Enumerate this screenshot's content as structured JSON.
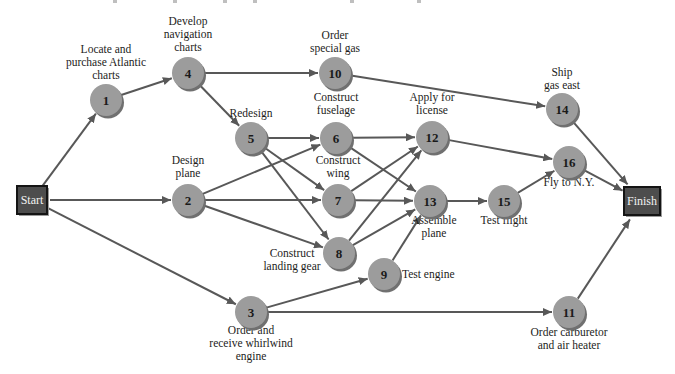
{
  "figure": {
    "background": "#ffffff",
    "cropped_caption_marks": [
      113,
      173,
      223,
      253,
      350,
      417
    ]
  },
  "network": {
    "type": "activity-on-node project network",
    "colors": {
      "node_fill": "#9c9c9c",
      "node_shadow": "#707070",
      "node_number": "#1a1a1a",
      "edge": "#585858",
      "terminal_fill": "#4d4d4d",
      "terminal_border": "#141414",
      "terminal_shadow": "#9a9a9a",
      "terminal_text": "#f2f2f2",
      "label_text": "#1d1d1b"
    },
    "node_radius": 16,
    "terminals": [
      {
        "id": "start",
        "label": "Start",
        "x": 32,
        "y": 200,
        "w": 30,
        "h": 28
      },
      {
        "id": "finish",
        "label": "Finish",
        "x": 642,
        "y": 201,
        "w": 36,
        "h": 28
      }
    ],
    "nodes": [
      {
        "id": "1",
        "x": 106,
        "y": 100,
        "label": {
          "lines": [
            "Locate and",
            "purchase Atlantic",
            "charts"
          ],
          "x": 106,
          "y": 53,
          "anchor": "middle"
        }
      },
      {
        "id": "4",
        "x": 188,
        "y": 73,
        "label": {
          "lines": [
            "Develop",
            "navigation",
            "charts"
          ],
          "x": 188,
          "y": 25,
          "anchor": "middle"
        }
      },
      {
        "id": "10",
        "x": 335,
        "y": 73,
        "label": {
          "lines": [
            "Order",
            "special gas"
          ],
          "x": 335,
          "y": 39,
          "anchor": "middle"
        }
      },
      {
        "id": "14",
        "x": 562,
        "y": 109,
        "label": {
          "lines": [
            "Ship",
            "gas east"
          ],
          "x": 562,
          "y": 76,
          "anchor": "middle"
        }
      },
      {
        "id": "5",
        "x": 251,
        "y": 138,
        "label": {
          "lines": [
            "Redesign"
          ],
          "x": 251,
          "y": 117,
          "anchor": "middle"
        }
      },
      {
        "id": "6",
        "x": 336,
        "y": 138,
        "label": {
          "lines": [
            "Construct",
            "fuselage"
          ],
          "x": 336,
          "y": 101,
          "anchor": "middle"
        }
      },
      {
        "id": "12",
        "x": 432,
        "y": 137,
        "label": {
          "lines": [
            "Apply for",
            "license"
          ],
          "x": 432,
          "y": 101,
          "anchor": "middle"
        }
      },
      {
        "id": "2",
        "x": 188,
        "y": 200,
        "label": {
          "lines": [
            "Design",
            "plane"
          ],
          "x": 188,
          "y": 164,
          "anchor": "middle"
        }
      },
      {
        "id": "7",
        "x": 338,
        "y": 200,
        "label": {
          "lines": [
            "Construct",
            "wing"
          ],
          "x": 338,
          "y": 164,
          "anchor": "middle"
        }
      },
      {
        "id": "13",
        "x": 430,
        "y": 201,
        "label": {
          "lines": [
            "Assemble",
            "plane"
          ],
          "x": 434,
          "y": 224,
          "anchor": "middle"
        }
      },
      {
        "id": "15",
        "x": 504,
        "y": 201,
        "label": {
          "lines": [
            "Test flight"
          ],
          "x": 504,
          "y": 224,
          "anchor": "middle"
        }
      },
      {
        "id": "16",
        "x": 569,
        "y": 162,
        "label": {
          "lines": [
            "Fly to N.Y."
          ],
          "x": 569,
          "y": 186,
          "anchor": "middle"
        }
      },
      {
        "id": "8",
        "x": 339,
        "y": 253,
        "label": {
          "lines": [
            "Construct",
            "landing gear"
          ],
          "x": 292,
          "y": 257,
          "anchor": "middle"
        }
      },
      {
        "id": "9",
        "x": 384,
        "y": 274,
        "label": {
          "lines": [
            "Test engine"
          ],
          "x": 402,
          "y": 278,
          "anchor": "start"
        }
      },
      {
        "id": "3",
        "x": 251,
        "y": 312,
        "label": {
          "lines": [
            "Order and",
            "receive whirlwind",
            "engine"
          ],
          "x": 251,
          "y": 334,
          "anchor": "middle"
        }
      },
      {
        "id": "11",
        "x": 569,
        "y": 312,
        "label": {
          "lines": [
            "Order carburetor",
            "and air heater"
          ],
          "x": 569,
          "y": 336,
          "anchor": "middle"
        }
      }
    ],
    "edges": [
      [
        "start",
        "1"
      ],
      [
        "start",
        "2"
      ],
      [
        "start",
        "3"
      ],
      [
        "1",
        "4"
      ],
      [
        "4",
        "10"
      ],
      [
        "4",
        "5"
      ],
      [
        "10",
        "14"
      ],
      [
        "14",
        "finish"
      ],
      [
        "5",
        "6"
      ],
      [
        "5",
        "7"
      ],
      [
        "5",
        "8"
      ],
      [
        "2",
        "6"
      ],
      [
        "2",
        "7"
      ],
      [
        "2",
        "8"
      ],
      [
        "6",
        "12"
      ],
      [
        "6",
        "13"
      ],
      [
        "7",
        "12"
      ],
      [
        "7",
        "13"
      ],
      [
        "8",
        "12"
      ],
      [
        "8",
        "13"
      ],
      [
        "3",
        "9"
      ],
      [
        "3",
        "11"
      ],
      [
        "9",
        "13"
      ],
      [
        "12",
        "16"
      ],
      [
        "13",
        "15"
      ],
      [
        "15",
        "16"
      ],
      [
        "16",
        "finish"
      ],
      [
        "11",
        "finish"
      ]
    ]
  }
}
